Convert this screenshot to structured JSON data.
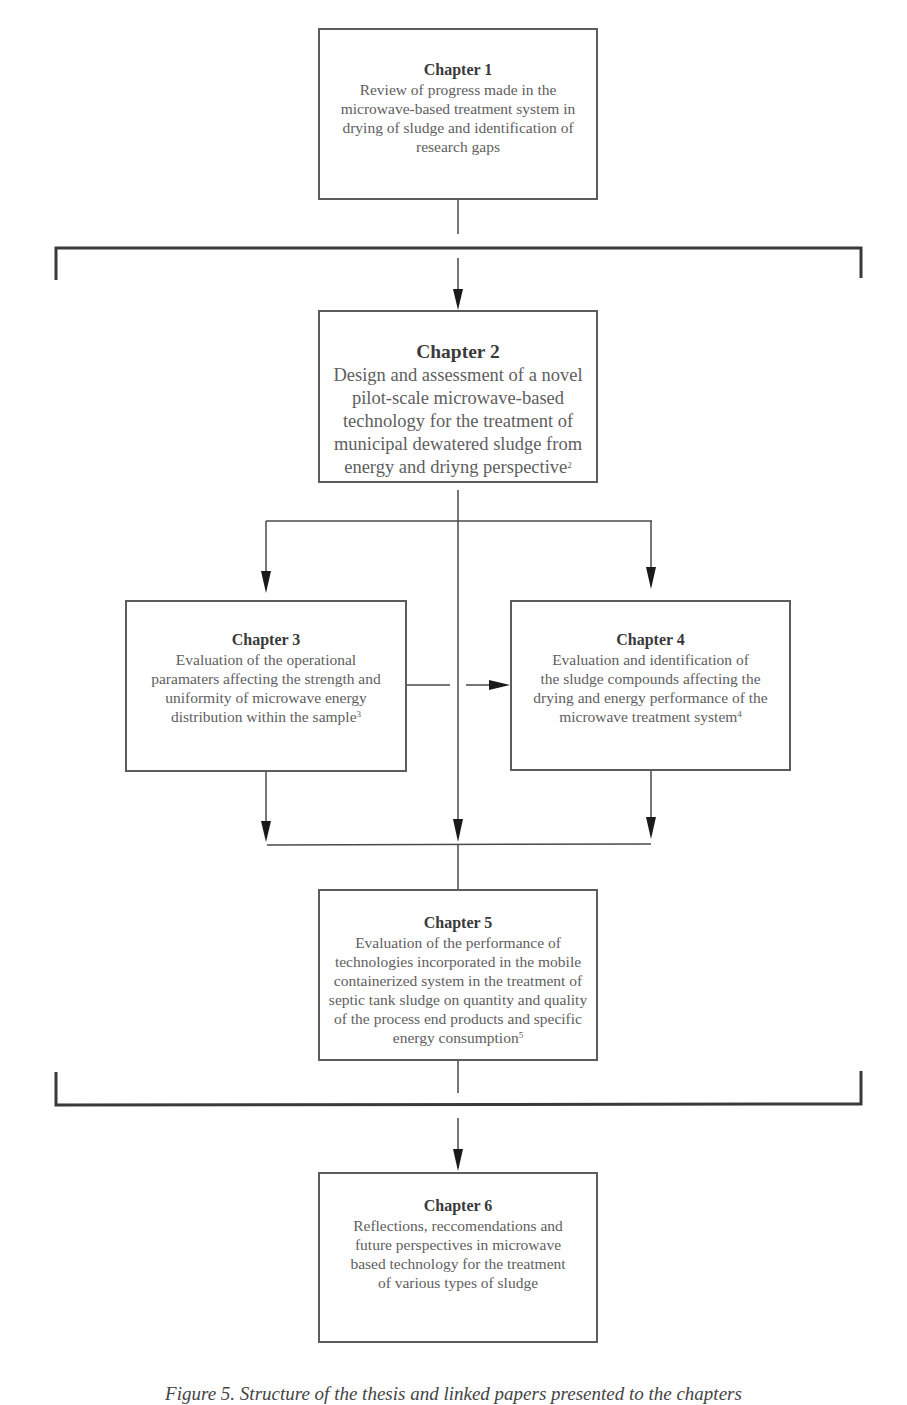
{
  "diagram": {
    "type": "thesis-structure-flowchart",
    "colors": {
      "line": "#4a4a4a",
      "bracket": "#3a3a3a",
      "box_border": "#5c5c5c",
      "text": "#5e5e5e",
      "title_text": "#3a3a3a"
    },
    "chapters": [
      {
        "id": "ch1",
        "title": "Chapter 1",
        "lines": [
          "Review of progress made in the",
          "microwave-based treatment system in",
          "drying of sludge and identification of",
          "research gaps"
        ],
        "footnote": ""
      },
      {
        "id": "ch2",
        "title": "Chapter 2",
        "lines": [
          "Design and assessment of a novel",
          "pilot-scale microwave-based",
          "technology for the treatment of",
          "municipal dewatered sludge from",
          "energy and driyng perspective"
        ],
        "footnote": "2"
      },
      {
        "id": "ch3",
        "title": "Chapter 3",
        "lines": [
          "Evaluation of the operational",
          "paramaters affecting the strength and",
          "uniformity of microwave energy",
          "distribution within the sample"
        ],
        "footnote": "3"
      },
      {
        "id": "ch4",
        "title": "Chapter 4",
        "lines": [
          "Evaluation and identification of",
          "the sludge compounds affecting the",
          "drying and energy performance of the",
          "microwave treatment system"
        ],
        "footnote": "4"
      },
      {
        "id": "ch5",
        "title": "Chapter 5",
        "lines": [
          "Evaluation of the performance of",
          "technologies incorporated in the mobile",
          "containerized system in the treatment of",
          "septic tank sludge on quantity and quality",
          "of the process end products and specific",
          "energy consumption"
        ],
        "footnote": "5"
      },
      {
        "id": "ch6",
        "title": "Chapter 6",
        "lines": [
          "Reflections, reccomendations and",
          "future perspectives in microwave",
          "based technology for the treatment",
          "of various types of sludge"
        ],
        "footnote": ""
      }
    ],
    "edges": [
      {
        "from": "Chapter 1",
        "to": "Chapter 2",
        "via": "top-bracket"
      },
      {
        "from": "Chapter 2",
        "to": "Chapter 3"
      },
      {
        "from": "Chapter 2",
        "to": "Chapter 4"
      },
      {
        "from": "Chapter 3",
        "to": "Chapter 4"
      },
      {
        "from": "Chapter 2",
        "to": "Chapter 5"
      },
      {
        "from": "Chapter 3",
        "to": "Chapter 5"
      },
      {
        "from": "Chapter 4",
        "to": "Chapter 5"
      },
      {
        "from": "Chapter 5",
        "to": "Chapter 6",
        "via": "bottom-bracket"
      }
    ]
  },
  "caption": "Figure 5. Structure of the thesis and linked papers presented to the chapters"
}
